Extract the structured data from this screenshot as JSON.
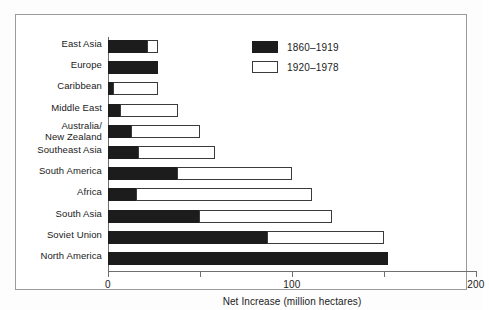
{
  "chart_data": {
    "type": "bar",
    "orientation": "horizontal",
    "stacked": true,
    "title": "",
    "xlabel": "Net Increase (million hectares)",
    "ylabel": "",
    "xlim": [
      0,
      200
    ],
    "xticks": [
      0,
      50,
      100,
      150,
      200
    ],
    "xtick_labels": [
      "0",
      "",
      "100",
      "",
      "200"
    ],
    "grid": false,
    "legend_position": "top-right",
    "categories": [
      "East Asia",
      "Europe",
      "Caribbean",
      "Middle East",
      "Australia/\nNew Zealand",
      "Southeast Asia",
      "South America",
      "Africa",
      "South Asia",
      "Soviet Union",
      "North America"
    ],
    "series": [
      {
        "name": "1860–1919",
        "color": "#1c1c1c",
        "values": [
          22,
          27,
          3,
          7,
          13,
          17,
          38,
          16,
          50,
          87,
          152
        ]
      },
      {
        "name": "1920–1978",
        "color": "#ffffff",
        "values": [
          5,
          0,
          24,
          31,
          37,
          41,
          62,
          95,
          72,
          63,
          0
        ]
      }
    ],
    "totals": [
      27,
      27,
      27,
      38,
      50,
      58,
      100,
      111,
      122,
      150,
      152
    ]
  },
  "axis": {
    "title": "Net Increase (million hectares)",
    "ticks": [
      {
        "value": 0,
        "label": "0"
      },
      {
        "value": 50,
        "label": ""
      },
      {
        "value": 100,
        "label": "100"
      },
      {
        "value": 150,
        "label": ""
      },
      {
        "value": 200,
        "label": "200"
      }
    ]
  },
  "legend": {
    "items": [
      {
        "label": "1860–1919",
        "style": "filled"
      },
      {
        "label": "1920–1978",
        "style": "hollow"
      }
    ]
  },
  "rows": [
    {
      "label": "East Asia",
      "label2": "",
      "black": 22,
      "white": 5
    },
    {
      "label": "Europe",
      "label2": "",
      "black": 27,
      "white": 0
    },
    {
      "label": "Caribbean",
      "label2": "",
      "black": 3,
      "white": 24
    },
    {
      "label": "Middle East",
      "label2": "",
      "black": 7,
      "white": 31
    },
    {
      "label": "Australia/",
      "label2": "New Zealand",
      "black": 13,
      "white": 37
    },
    {
      "label": "Southeast Asia",
      "label2": "",
      "black": 17,
      "white": 41
    },
    {
      "label": "South America",
      "label2": "",
      "black": 38,
      "white": 62
    },
    {
      "label": "Africa",
      "label2": "",
      "black": 16,
      "white": 95
    },
    {
      "label": "South Asia",
      "label2": "",
      "black": 50,
      "white": 72
    },
    {
      "label": "Soviet Union",
      "label2": "",
      "black": 87,
      "white": 63
    },
    {
      "label": "North America",
      "label2": "",
      "black": 152,
      "white": 0
    }
  ]
}
